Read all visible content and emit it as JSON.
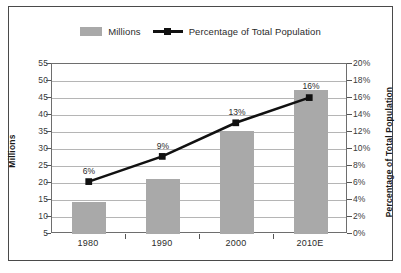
{
  "chart_data": {
    "type": "bar",
    "title": "",
    "subtitle": "",
    "categories": [
      "1980",
      "1990",
      "2000",
      "2010E"
    ],
    "series": [
      {
        "name": "Millions",
        "type": "bar",
        "axis": "left",
        "values": [
          14.3,
          21.1,
          35.3,
          47.5
        ],
        "color": "#a9a9a9"
      },
      {
        "name": "Percentage of Total Population",
        "type": "line",
        "axis": "right",
        "values": [
          6,
          9,
          13,
          16
        ],
        "data_labels": [
          "6%",
          "9%",
          "13%",
          "16%"
        ],
        "color": "#111111",
        "marker": "square"
      }
    ],
    "xlabel": "",
    "ylabel": "Millions",
    "y2label": "Percentage of Total Population",
    "ylim": [
      5,
      55
    ],
    "y2lim": [
      0,
      20
    ],
    "yticks": [
      "55",
      "50",
      "45",
      "40",
      "35",
      "30",
      "25",
      "20",
      "15",
      "10",
      "5"
    ],
    "y2ticks": [
      "20%",
      "18%",
      "16%",
      "14%",
      "12%",
      "10%",
      "8%",
      "6%",
      "4%",
      "2%",
      "0%"
    ],
    "grid": true,
    "legend_position": "top-center"
  },
  "legend": {
    "items": [
      {
        "label": "Millions",
        "marker": "bar-swatch",
        "color": "#a9a9a9"
      },
      {
        "label": "Percentage of Total Population",
        "marker": "line-square",
        "color": "#111111"
      }
    ]
  },
  "axes": {
    "left_title": "Millions",
    "right_title": "Percentage of Total Population"
  },
  "colors": {
    "bar_fill": "#a9a9a9",
    "line": "#111111",
    "grid": "#b5b5b5",
    "plot_border": "#6e6e6e",
    "outer_border": "#4a4a4a",
    "background": "#ffffff",
    "text": "#2b2b2b"
  }
}
